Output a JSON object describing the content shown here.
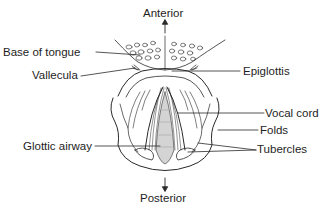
{
  "diagram": {
    "type": "anatomical-labeled-illustration",
    "orientation": {
      "top": "Anterior",
      "bottom": "Posterior"
    },
    "labels": {
      "anterior": "Anterior",
      "posterior": "Posterior",
      "base_of_tongue": "Base of tongue",
      "vallecula": "Vallecula",
      "epiglottis": "Epiglottis",
      "vocal_cord": "Vocal cord",
      "folds": "Folds",
      "tubercles": "Tubercles",
      "glottic_airway": "Glottic airway"
    },
    "colors": {
      "line": "#2a2a2a",
      "text": "#1e1e1e",
      "airway_fill": "#d4d4d4",
      "background": "#ffffff"
    }
  }
}
